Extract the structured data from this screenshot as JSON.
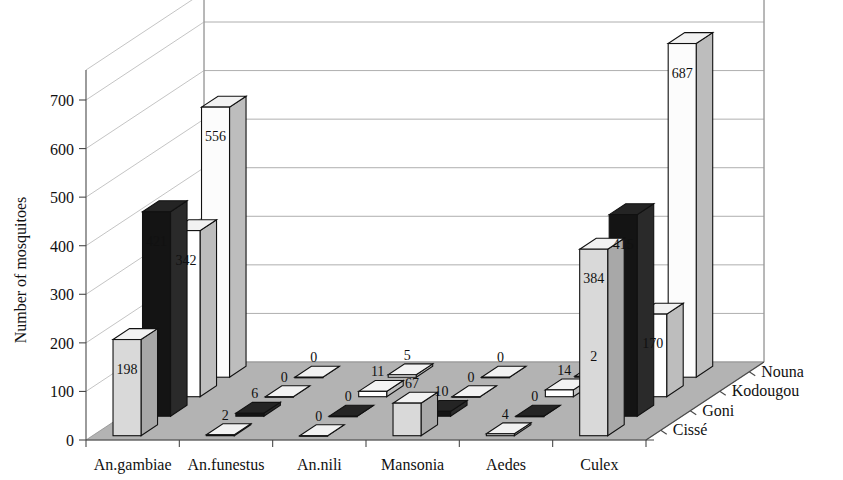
{
  "chart_data": {
    "type": "bar",
    "title": "",
    "subtitle": "",
    "xlabel": "",
    "ylabel": "Number of mosquitoes",
    "zlabel": "",
    "ylim": [
      0,
      700
    ],
    "ytick_step": 100,
    "yticks": [
      "0",
      "100",
      "200",
      "300",
      "400",
      "500",
      "600",
      "700"
    ],
    "grid": true,
    "legend_position": "depth-axis-right",
    "projection": "3d",
    "categories": [
      "An.gambiae",
      "An.funestus",
      "An.nili",
      "Mansonia",
      "Aedes",
      "Culex"
    ],
    "series": [
      {
        "name": "Cissé",
        "color": "#d9d9d9",
        "values": [
          198,
          2,
          0,
          67,
          4,
          384
        ],
        "labels": [
          "198",
          "2",
          "0",
          "67",
          "4",
          "384"
        ]
      },
      {
        "name": "Goni",
        "color": "#141414",
        "values": [
          421,
          6,
          0,
          10,
          0,
          415
        ],
        "labels": [
          "421",
          "6",
          "0",
          "10",
          "0",
          "415"
        ]
      },
      {
        "name": "Kodougou",
        "color": "#ffffff",
        "values": [
          342,
          0,
          11,
          0,
          14,
          170
        ],
        "labels": [
          "342",
          "0",
          "11",
          "0",
          "14",
          "170"
        ]
      },
      {
        "name": "Nouna",
        "color": "#fcfcfc",
        "values": [
          556,
          0,
          5,
          0,
          2,
          687
        ],
        "labels": [
          "556",
          "0",
          "5",
          "0",
          "2",
          "687"
        ]
      }
    ]
  },
  "axes": {
    "y_title": "Number of mosquitoes",
    "y_ticks": [
      "0",
      "100",
      "200",
      "300",
      "400",
      "500",
      "600",
      "700"
    ],
    "x_ticks": [
      "An.gambiae",
      "An.funestus",
      "An.nili",
      "Mansonia",
      "Aedes",
      "Culex"
    ],
    "z_ticks": [
      "Cissé",
      "Goni",
      "Kodougou",
      "Nouna"
    ]
  },
  "values": {
    "an_gambiae": {
      "cisse": "198",
      "goni": "421",
      "kodougou": "342",
      "nouna": "556"
    },
    "an_funestus": {
      "cisse": "2",
      "goni": "6",
      "kodougou": "0",
      "nouna": "0"
    },
    "an_nili": {
      "cisse": "0",
      "goni": "0",
      "kodougou": "11",
      "nouna": "5"
    },
    "mansonia": {
      "cisse": "67",
      "goni": "10",
      "kodougou": "0",
      "nouna": "0"
    },
    "aedes": {
      "cisse": "4",
      "goni": "0",
      "kodougou": "14",
      "nouna": "2"
    },
    "culex": {
      "cisse": "384",
      "goni": "415",
      "kodougou": "170",
      "nouna": "687"
    }
  },
  "colors": {
    "series_cisse": "#d9d9d9",
    "series_goni": "#141414",
    "series_kodougou": "#ffffff",
    "series_nouna": "#fcfcfc",
    "floor": "#b3b3b3",
    "grid": "#9a9a9a",
    "outline": "#111111",
    "background": "#ffffff"
  }
}
